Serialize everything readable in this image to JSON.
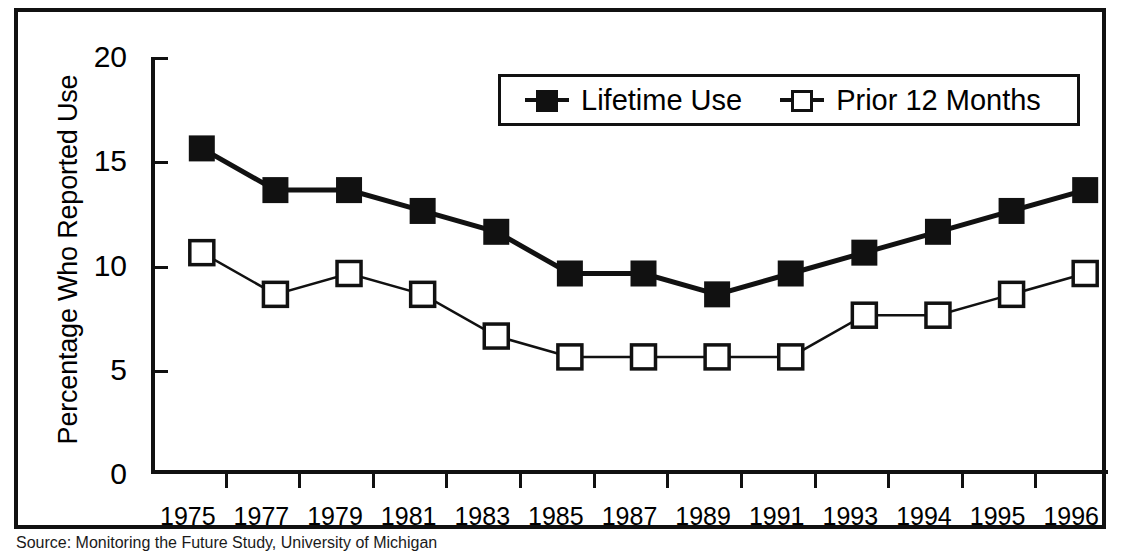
{
  "figure": {
    "source_note": "Source: Monitoring the Future Study, University of Michigan"
  },
  "legend": {
    "position": "top-center-inside",
    "entries": [
      {
        "label": "Lifetime Use",
        "marker": "filled-square",
        "color": "#111111"
      },
      {
        "label": "Prior 12 Months",
        "marker": "open-square",
        "color": "#111111"
      }
    ]
  },
  "axes": {
    "y_title": "Percentage Who Reported Use",
    "y_ticks": [
      "0",
      "5",
      "10",
      "15",
      "20"
    ],
    "x_title": ""
  },
  "chart_data": {
    "type": "line",
    "title": "",
    "subtitle": "",
    "xlabel": "",
    "ylabel": "Percentage Who Reported Use",
    "categories": [
      "1975",
      "1977",
      "1979",
      "1981",
      "1983",
      "1985",
      "1987",
      "1989",
      "1991",
      "1993",
      "1994",
      "1995",
      "1996"
    ],
    "series": [
      {
        "name": "Lifetime Use",
        "marker": "filled-square",
        "values": [
          16,
          14,
          14,
          13,
          12,
          10,
          10,
          9,
          10,
          11,
          12,
          13,
          14
        ]
      },
      {
        "name": "Prior 12 Months",
        "marker": "open-square",
        "values": [
          11,
          9,
          10,
          9,
          7,
          6,
          6,
          6,
          6,
          8,
          8,
          9,
          10
        ]
      }
    ],
    "ylim": [
      0,
      20
    ],
    "yticks": [
      0,
      5,
      10,
      15,
      20
    ],
    "grid": false,
    "legend_position": "top-center"
  }
}
